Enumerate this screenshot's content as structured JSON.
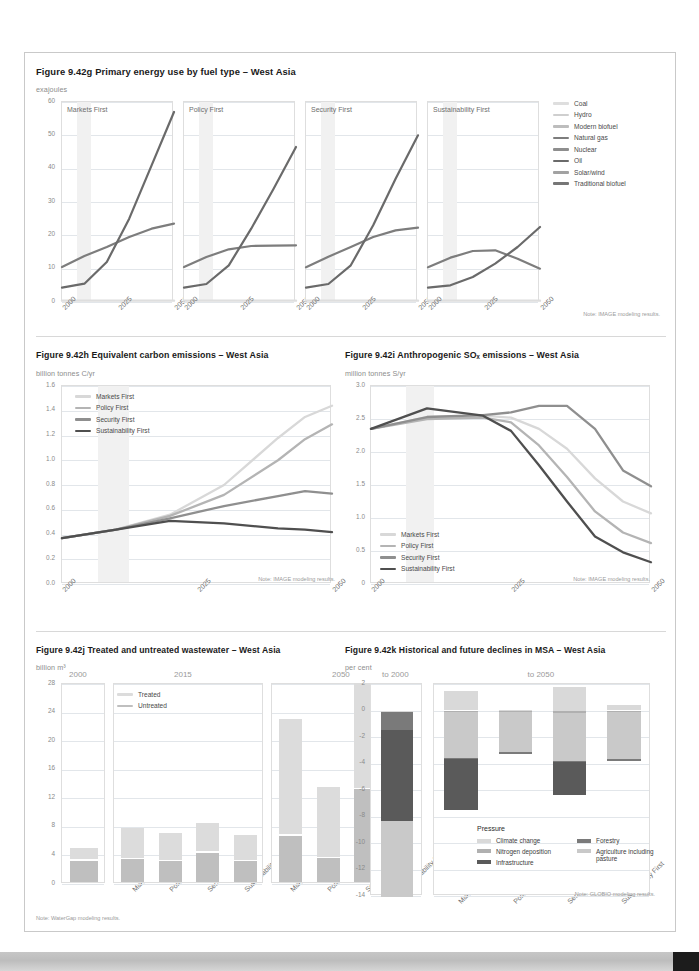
{
  "page": {
    "bottom_band_color": "#c6c6c6",
    "corner_color": "#1c1c1c"
  },
  "palette": {
    "s1_markets": "#d8d8d8",
    "s2_policy": "#b4b4b4",
    "s3_security": "#8f8f8f",
    "s4_sustainability": "#4f4f4f",
    "grid": "#e2e6ea",
    "band": "#f1f1f1",
    "axis_text": "#8a8a8a",
    "title_text": "#1a1a1a"
  },
  "fig_g": {
    "title": "Figure 9.42g  Primary energy use by fuel type – West Asia",
    "units": "exajoules",
    "note": "Note: IMAGE modeling results.",
    "panels": [
      "Markets First",
      "Policy First",
      "Security First",
      "Sustainability First"
    ],
    "legend": [
      {
        "label": "Coal",
        "color": "#dedede"
      },
      {
        "label": "Hydro",
        "color": "#cfcfcf"
      },
      {
        "label": "Modern biofuel",
        "color": "#bdbdbd"
      },
      {
        "label": "Natural gas",
        "color": "#7d7d7d"
      },
      {
        "label": "Nuclear",
        "color": "#8e8e8e"
      },
      {
        "label": "Oil",
        "color": "#6a6a6a"
      },
      {
        "label": "Solar/wind",
        "color": "#a2a2a2"
      },
      {
        "label": "Traditional biofuel",
        "color": "#767676"
      }
    ],
    "chart_data": {
      "type": "line",
      "title": "Primary energy use by fuel type – West Asia",
      "ylabel": "exajoules",
      "xlabel": "",
      "ylim": [
        0,
        60
      ],
      "yticks": [
        0,
        10,
        20,
        30,
        40,
        50,
        60
      ],
      "x": [
        2000,
        2010,
        2020,
        2030,
        2040,
        2050
      ],
      "xticks": [
        2000,
        2025,
        2050
      ],
      "grid": true,
      "panels": [
        {
          "name": "Markets First",
          "series": [
            {
              "name": "Natural gas",
              "values": [
                10.5,
                13.8,
                16.5,
                19.5,
                22.0,
                23.5
              ]
            },
            {
              "name": "Oil",
              "values": [
                4.3,
                5.5,
                12.0,
                25.0,
                41.0,
                57.0
              ]
            },
            {
              "name": "Coal",
              "values": [
                0.4,
                0.4,
                0.4,
                0.4,
                0.4,
                0.4
              ]
            }
          ]
        },
        {
          "name": "Policy First",
          "series": [
            {
              "name": "Natural gas",
              "values": [
                10.5,
                13.5,
                15.8,
                16.8,
                16.9,
                17.0
              ]
            },
            {
              "name": "Oil",
              "values": [
                4.3,
                5.4,
                11.0,
                22.0,
                34.0,
                46.5
              ]
            },
            {
              "name": "Coal",
              "values": [
                0.4,
                0.4,
                0.4,
                0.4,
                0.4,
                0.4
              ]
            }
          ]
        },
        {
          "name": "Security First",
          "series": [
            {
              "name": "Natural gas",
              "values": [
                10.4,
                13.6,
                16.5,
                19.5,
                21.5,
                22.3
              ]
            },
            {
              "name": "Oil",
              "values": [
                4.3,
                5.4,
                11.0,
                23.0,
                37.0,
                50.0
              ]
            },
            {
              "name": "Coal",
              "values": [
                0.4,
                0.4,
                0.4,
                0.4,
                0.4,
                0.4
              ]
            }
          ]
        },
        {
          "name": "Sustainability First",
          "series": [
            {
              "name": "Natural gas",
              "values": [
                10.4,
                13.3,
                15.3,
                15.5,
                13.0,
                10.0
              ]
            },
            {
              "name": "Oil",
              "values": [
                4.3,
                5.0,
                7.5,
                11.5,
                16.5,
                22.5
              ]
            },
            {
              "name": "Coal",
              "values": [
                0.4,
                0.4,
                0.4,
                0.4,
                0.4,
                0.4
              ]
            }
          ]
        }
      ]
    }
  },
  "fig_h": {
    "title": "Figure 9.42h Equivalent carbon emissions – West Asia",
    "units": "billion tonnes C/yr",
    "note": "Note: IMAGE modeling results.",
    "legend": [
      {
        "label": "Markets First",
        "color": "#d8d8d8"
      },
      {
        "label": "Policy First",
        "color": "#b4b4b4"
      },
      {
        "label": "Security First",
        "color": "#8f8f8f"
      },
      {
        "label": "Sustainability First",
        "color": "#4f4f4f"
      }
    ],
    "chart_data": {
      "type": "line",
      "title": "Equivalent carbon emissions – West Asia",
      "ylabel": "billion tonnes C/yr",
      "xlabel": "",
      "ylim": [
        0.0,
        1.6
      ],
      "yticks": [
        0.0,
        0.2,
        0.4,
        0.6,
        0.8,
        1.0,
        1.2,
        1.4,
        1.6
      ],
      "x": [
        2000,
        2010,
        2020,
        2030,
        2040,
        2045,
        2050
      ],
      "xticks": [
        2000,
        2025,
        2050
      ],
      "grid": true,
      "series": [
        {
          "name": "Markets First",
          "values": [
            0.37,
            0.44,
            0.56,
            0.8,
            1.18,
            1.35,
            1.44
          ]
        },
        {
          "name": "Policy First",
          "values": [
            0.37,
            0.44,
            0.55,
            0.72,
            1.0,
            1.17,
            1.29
          ]
        },
        {
          "name": "Security First",
          "values": [
            0.37,
            0.44,
            0.53,
            0.63,
            0.71,
            0.75,
            0.73
          ]
        },
        {
          "name": "Sustainability First",
          "values": [
            0.37,
            0.44,
            0.51,
            0.49,
            0.45,
            0.44,
            0.42
          ]
        }
      ]
    }
  },
  "fig_i": {
    "title": "Figure 9.42i Anthropogenic SOₓ emissions – West Asia",
    "units": "million tonnes S/yr",
    "note": "Note: IMAGE modeling results.",
    "legend": [
      {
        "label": "Markets First",
        "color": "#d8d8d8"
      },
      {
        "label": "Policy First",
        "color": "#b4b4b4"
      },
      {
        "label": "Security First",
        "color": "#8f8f8f"
      },
      {
        "label": "Sustainability First",
        "color": "#4f4f4f"
      }
    ],
    "chart_data": {
      "type": "line",
      "title": "Anthropogenic SOx emissions – West Asia",
      "ylabel": "million tonnes S/yr",
      "xlabel": "",
      "ylim": [
        0,
        3.0
      ],
      "yticks": [
        0,
        0.5,
        1.0,
        1.5,
        2.0,
        2.5,
        3.0
      ],
      "x": [
        2000,
        2010,
        2020,
        2025,
        2030,
        2035,
        2040,
        2045,
        2050
      ],
      "xticks": [
        2000,
        2025,
        2050
      ],
      "grid": true,
      "series": [
        {
          "name": "Markets First",
          "values": [
            2.35,
            2.53,
            2.55,
            2.52,
            2.35,
            2.05,
            1.6,
            1.25,
            1.07
          ]
        },
        {
          "name": "Policy First",
          "values": [
            2.35,
            2.5,
            2.52,
            2.45,
            2.1,
            1.62,
            1.1,
            0.78,
            0.62
          ]
        },
        {
          "name": "Security First",
          "values": [
            2.35,
            2.53,
            2.56,
            2.6,
            2.7,
            2.7,
            2.35,
            1.72,
            1.48
          ]
        },
        {
          "name": "Sustainability First",
          "values": [
            2.35,
            2.66,
            2.55,
            2.32,
            1.8,
            1.25,
            0.72,
            0.48,
            0.33
          ]
        }
      ]
    }
  },
  "fig_j": {
    "title": "Figure 9.42j Treated and untreated wastewater – West Asia",
    "units": "billion m³",
    "note": "Note: WaterGap modeling results.",
    "legend": [
      {
        "label": "Treated",
        "color": "#dcdcdc"
      },
      {
        "label": "Untreated",
        "color": "#bfbfbf"
      }
    ],
    "panel_labels": [
      "2000",
      "2015",
      "2050"
    ],
    "scenarios": [
      "Markets First",
      "Policy First",
      "Security First",
      "Sustainability First"
    ],
    "chart_data": {
      "type": "bar",
      "title": "Treated and untreated wastewater – West Asia",
      "ylabel": "billion m³",
      "xlabel": "",
      "ylim": [
        0,
        28
      ],
      "yticks": [
        0,
        4,
        8,
        12,
        16,
        20,
        24,
        28
      ],
      "stacked": true,
      "stack_order": [
        "Untreated",
        "Treated"
      ],
      "panels": [
        {
          "name": "2000",
          "categories": [
            "2000"
          ],
          "series": [
            {
              "name": "Untreated",
              "values": [
                3.0
              ]
            },
            {
              "name": "Treated",
              "values": [
                1.7
              ]
            }
          ]
        },
        {
          "name": "2015",
          "categories": [
            "Markets First",
            "Policy First",
            "Security First",
            "Sustainability First"
          ],
          "series": [
            {
              "name": "Untreated",
              "values": [
                3.2,
                2.9,
                4.1,
                2.9
              ]
            },
            {
              "name": "Treated",
              "values": [
                4.4,
                3.9,
                4.2,
                3.7
              ]
            }
          ]
        },
        {
          "name": "2050",
          "categories": [
            "Markets First",
            "Policy First",
            "Security First",
            "Sustainability First"
          ],
          "series": [
            {
              "name": "Untreated",
              "values": [
                6.5,
                3.3,
                13.0,
                2.8
              ]
            },
            {
              "name": "Treated",
              "values": [
                16.3,
                10.0,
                14.8,
                6.7
              ]
            }
          ]
        }
      ]
    }
  },
  "fig_k": {
    "title": "Figure 9.42k Historical and future declines in MSA – West Asia",
    "units": "per cent",
    "note": "Note: GLOBIO modeling results.",
    "panel_labels": [
      "to 2000",
      "to 2050"
    ],
    "scenarios": [
      "Markets First",
      "Policy First",
      "Security First",
      "Sustainability First"
    ],
    "legend_head": "Pressure",
    "legend": [
      {
        "label": "Climate change",
        "color": "#d9d9d9"
      },
      {
        "label": "Nitrogen deposition",
        "color": "#b0b0b0"
      },
      {
        "label": "Infrastructure",
        "color": "#5a5a5a"
      },
      {
        "label": "Forestry",
        "color": "#7a7a7a"
      },
      {
        "label": "Agriculture including pasture",
        "color": "#c9c9c9"
      }
    ],
    "chart_data": {
      "type": "bar",
      "title": "Historical and future declines in MSA – West Asia",
      "ylabel": "per cent",
      "xlabel": "",
      "ylim": [
        -14,
        2
      ],
      "yticks": [
        2,
        0,
        -2,
        -4,
        -6,
        -8,
        -10,
        -12,
        -14
      ],
      "stacked": true,
      "panels": [
        {
          "name": "to 2000",
          "categories": [
            "to 2000"
          ],
          "series": [
            {
              "name": "Climate change",
              "values": [
                -0.15
              ]
            },
            {
              "name": "Forestry",
              "values": [
                -1.35
              ]
            },
            {
              "name": "Infrastructure",
              "values": [
                -6.85
              ]
            },
            {
              "name": "Agriculture including pasture",
              "values": [
                -5.7
              ]
            }
          ]
        },
        {
          "name": "to 2050",
          "categories": [
            "Markets First",
            "Policy First",
            "Security First",
            "Sustainability First"
          ],
          "series": [
            {
              "name": "Climate change",
              "values": [
                1.45,
                0.05,
                1.75,
                0.45
              ]
            },
            {
              "name": "Nitrogen deposition",
              "values": [
                -0.15,
                -0.1,
                -0.2,
                -0.1
              ]
            },
            {
              "name": "Agriculture including pasture",
              "values": [
                -3.4,
                -3.05,
                -3.6,
                -3.55
              ]
            },
            {
              "name": "Forestry",
              "values": [
                -0.1,
                -0.15,
                -0.1,
                -0.15
              ]
            },
            {
              "name": "Infrastructure",
              "values": [
                -3.85,
                0.0,
                -2.5,
                0.0
              ]
            }
          ]
        }
      ]
    }
  }
}
